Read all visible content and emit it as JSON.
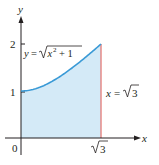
{
  "chart_data": {
    "type": "area",
    "title": "",
    "xlabel": "x",
    "ylabel": "y",
    "xlim": [
      0,
      2.15
    ],
    "ylim": [
      0,
      2.4
    ],
    "x_ticks": [
      {
        "value": 0,
        "label": "0"
      },
      {
        "value": 1.732,
        "label": "√3"
      }
    ],
    "y_ticks": [
      {
        "value": 1,
        "label": "1"
      },
      {
        "value": 2,
        "label": "2"
      }
    ],
    "grid": false,
    "legend": "none",
    "series": [
      {
        "name": "y = √(x² + 1)",
        "function": "sqrt(x^2+1)",
        "x_range": [
          0,
          1.732
        ],
        "points": [
          [
            0,
            1.0
          ],
          [
            0.25,
            1.031
          ],
          [
            0.5,
            1.118
          ],
          [
            0.75,
            1.25
          ],
          [
            1.0,
            1.414
          ],
          [
            1.25,
            1.601
          ],
          [
            1.5,
            1.803
          ],
          [
            1.732,
            2.0
          ]
        ],
        "color": "#3a9ad6",
        "fill": "#d4eaf7"
      }
    ],
    "boundary_line": {
      "x": 1.732,
      "label": "x = √3",
      "color": "#e0554f"
    },
    "annotations": [
      {
        "text_parts": [
          "y = ",
          "x",
          "2",
          " + 1"
        ],
        "text": "y = √(x² + 1)",
        "position": "top-left"
      },
      {
        "text": "x = √3",
        "position": "right"
      }
    ]
  },
  "labels": {
    "y_axis": "y",
    "x_axis": "x",
    "origin": "0",
    "tick_y1": "1",
    "tick_y2": "2",
    "tick_xroot": "3",
    "curve_y": "y",
    "curve_eq": "=",
    "curve_x": "x",
    "curve_exp": "2",
    "curve_plus": "+ 1",
    "line_x": "x",
    "line_eq": "=",
    "line_root": "3"
  },
  "colors": {
    "axis": "#231f20",
    "curve": "#3a9ad6",
    "fill": "#d4eaf7",
    "boundary": "#e0554f"
  }
}
